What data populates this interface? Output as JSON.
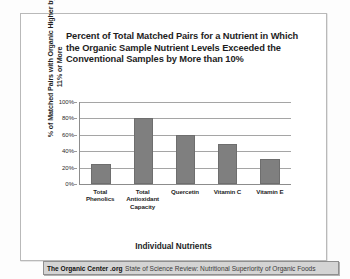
{
  "chart_data": {
    "type": "bar",
    "title": "Percent of Total Matched Pairs for a Nutrient in Which the Organic Sample Nutrient Levels Exceeded the Conventional Samples by More than 10%",
    "xlabel": "Individual Nutrients",
    "ylabel": "% of Matched Pairs with Organic Higher by 11% or More",
    "categories": [
      "Total Phenolics",
      "Total Antioxidant Capacity",
      "Quercetin",
      "Vitamin C",
      "Vitamin E"
    ],
    "values": [
      24,
      80,
      60,
      49,
      30
    ],
    "ylim": [
      0,
      100
    ],
    "yticks": [
      "0%",
      "20%",
      "40%",
      "60%",
      "80%",
      "100%"
    ],
    "ytick_values": [
      0,
      20,
      40,
      60,
      80,
      100
    ],
    "grid": true,
    "legend": "none",
    "bar_color": "#7f7f7f"
  },
  "footer": {
    "brand": "The Organic Center .org",
    "subtitle": "State of Science Review: Nutritional Superiority of Organic Foods"
  }
}
